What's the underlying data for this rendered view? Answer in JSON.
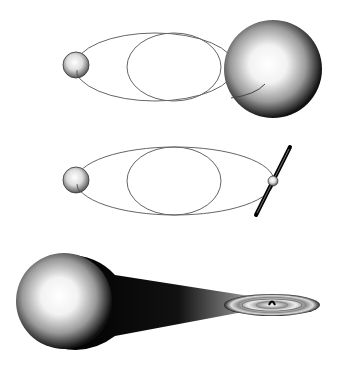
{
  "figure": {
    "panels": [
      {
        "id": "panel-1",
        "label": "Binary with giant companion and crossing orbits"
      },
      {
        "id": "panel-2",
        "label": "Binary with compact object emitting bipolar jets"
      },
      {
        "id": "panel-3",
        "label": "Mass transfer stream from star to accretion disk"
      }
    ]
  },
  "colors": {
    "background": "#ffffff",
    "orbit_line": "#666666",
    "sphere_highlight": "#ffffff",
    "sphere_shadow": "#000000"
  }
}
